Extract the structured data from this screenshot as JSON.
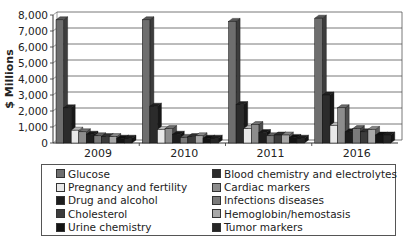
{
  "chart_data": {
    "type": "bar",
    "style": "3d-clustered",
    "title": "",
    "xlabel": "",
    "ylabel": "$ Millions",
    "ylim": [
      0,
      8000
    ],
    "yticks": [
      "0",
      "1,000",
      "2,000",
      "3,000",
      "4,000",
      "5,000",
      "6,000",
      "7,000",
      "8,000"
    ],
    "grid": true,
    "legend_position": "bottom",
    "categories": [
      "2009",
      "2010",
      "2011",
      "2016"
    ],
    "series": [
      {
        "name": "Glucose",
        "color": "#6e6e6e",
        "values": [
          7700,
          7700,
          7600,
          7800
        ]
      },
      {
        "name": "Blood chemistry and electrolytes",
        "color": "#2b2b2b",
        "values": [
          2200,
          2300,
          2400,
          3000
        ]
      },
      {
        "name": "Pregnancy and fertility",
        "color": "#e8e8e8",
        "values": [
          800,
          850,
          900,
          1100
        ]
      },
      {
        "name": "Cardiac markers",
        "color": "#8c8c8c",
        "values": [
          700,
          900,
          1150,
          2200
        ]
      },
      {
        "name": "Drug and alcohol",
        "color": "#1e1e1e",
        "values": [
          550,
          550,
          650,
          700
        ]
      },
      {
        "name": "Infections diseases",
        "color": "#7a7a7a",
        "values": [
          450,
          350,
          450,
          900
        ]
      },
      {
        "name": "Cholesterol",
        "color": "#3c3c3c",
        "values": [
          400,
          400,
          500,
          700
        ]
      },
      {
        "name": "Hemoglobin/hemostasis",
        "color": "#a8a8a8",
        "values": [
          400,
          450,
          500,
          850
        ]
      },
      {
        "name": "Urine chemistry",
        "color": "#141414",
        "values": [
          300,
          300,
          350,
          500
        ]
      },
      {
        "name": "Tumor markers",
        "color": "#262626",
        "values": [
          300,
          300,
          300,
          500
        ]
      }
    ]
  },
  "legend": {
    "col1": [
      "Glucose",
      "Pregnancy and fertility",
      "Drug and alcohol",
      "Cholesterol",
      "Urine chemistry"
    ],
    "col2": [
      "Blood chemistry and electrolytes",
      "Cardiac markers",
      "Infections diseases",
      "Hemoglobin/hemostasis",
      "Tumor markers"
    ]
  }
}
